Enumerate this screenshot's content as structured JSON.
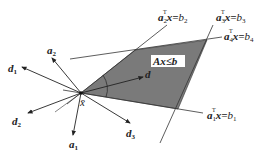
{
  "figure": {
    "region_label": "Ax≤b",
    "point_label": "x̄",
    "direction_label": "d",
    "constraints": [
      {
        "a": "a",
        "i": "1",
        "b": "b",
        "eq": "x="
      },
      {
        "a": "a",
        "i": "2",
        "b": "b",
        "eq": "x="
      },
      {
        "a": "a",
        "i": "3",
        "b": "b",
        "eq": "x="
      },
      {
        "a": "a",
        "i": "4",
        "b": "b",
        "eq": "x="
      }
    ],
    "transpose": "T",
    "normals": [
      {
        "name": "a",
        "i": "1"
      },
      {
        "name": "a",
        "i": "2"
      }
    ],
    "directions": [
      {
        "name": "d",
        "i": "1"
      },
      {
        "name": "d",
        "i": "2"
      },
      {
        "name": "d",
        "i": "3"
      }
    ],
    "colors": {
      "region": "#7a7a7a",
      "line": "#333333"
    }
  }
}
